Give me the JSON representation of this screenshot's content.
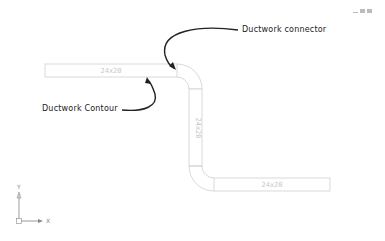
{
  "window_controls": [
    "minimize",
    "restore",
    "close"
  ],
  "annotations": {
    "connector_label": "Ductwork connector",
    "contour_label": "Ductwork Contour"
  },
  "duct_segments": [
    {
      "id": "horizontal-top",
      "size": "24x20"
    },
    {
      "id": "vertical",
      "size": "24x20"
    },
    {
      "id": "horizontal-bottom",
      "size": "24x20"
    }
  ],
  "ucs": {
    "x_label": "X",
    "y_label": "Y"
  },
  "colors": {
    "duct_line": "#cfcfcf",
    "arrow": "#222222",
    "background": "#ffffff"
  }
}
